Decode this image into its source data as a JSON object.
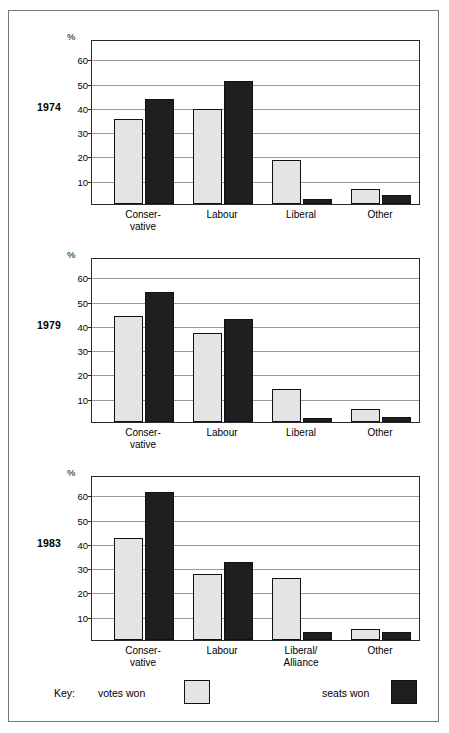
{
  "chart_data": {
    "type": "bar",
    "title": "",
    "xlabel": "",
    "ylabel": "%",
    "ylim": [
      0,
      68
    ],
    "yticks": [
      10,
      20,
      30,
      40,
      50,
      60
    ],
    "grid": true,
    "legend_position": "bottom",
    "legend": {
      "key_word": "Key:",
      "entries": [
        {
          "name": "votes won",
          "color": "#e4e4e4"
        },
        {
          "name": "seats won",
          "color": "#1f1f1f"
        }
      ]
    },
    "panels": [
      {
        "year": "1974",
        "axis_unit": "%",
        "categories": [
          "Conser-\nvative",
          "Labour",
          "Liberal",
          "Other"
        ],
        "category_lines": [
          [
            "Conser-",
            "vative"
          ],
          [
            "Labour"
          ],
          [
            "Liberal"
          ],
          [
            "Other"
          ]
        ],
        "series": [
          {
            "name": "votes won",
            "values": [
              35.2,
              39.0,
              18.3,
              6.3
            ]
          },
          {
            "name": "seats won",
            "values": [
              43.3,
              50.8,
              2.2,
              3.8
            ]
          }
        ]
      },
      {
        "year": "1979",
        "axis_unit": "%",
        "categories": [
          "Conser-\nvative",
          "Labour",
          "Liberal",
          "Other"
        ],
        "category_lines": [
          [
            "Conser-",
            "vative"
          ],
          [
            "Labour"
          ],
          [
            "Liberal"
          ],
          [
            "Other"
          ]
        ],
        "series": [
          {
            "name": "votes won",
            "values": [
              43.5,
              36.5,
              13.8,
              5.3
            ]
          },
          {
            "name": "seats won",
            "values": [
              53.5,
              42.4,
              1.7,
              2.2
            ]
          }
        ]
      },
      {
        "year": "1983",
        "axis_unit": "%",
        "categories": [
          "Conser-\nvative",
          "Labour",
          "Liberal/\nAlliance",
          "Other"
        ],
        "category_lines": [
          [
            "Conser-",
            "vative"
          ],
          [
            "Labour"
          ],
          [
            "Liberal/",
            "Alliance"
          ],
          [
            "Other"
          ]
        ],
        "series": [
          {
            "name": "votes won",
            "values": [
              42.2,
              27.3,
              25.4,
              4.6
            ]
          },
          {
            "name": "seats won",
            "values": [
              61.0,
              32.2,
              3.5,
              3.1
            ]
          }
        ]
      }
    ]
  },
  "colors": {
    "votes_fill": "#e4e4e4",
    "seats_fill": "#1f1f1f",
    "bar_outline": "#111111",
    "gridline": "#9a9a9a",
    "axis": "#2b2b2b",
    "frame": "#777777"
  }
}
